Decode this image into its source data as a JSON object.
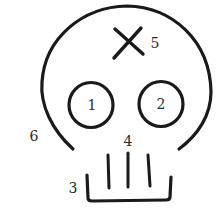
{
  "diagram": {
    "colors": {
      "background": "#ffffff",
      "stroke": "#1a1a1a",
      "label": "#2a2a2a"
    },
    "labels": {
      "left_eye": "1",
      "right_eye": "2",
      "jaw": "3",
      "teeth": "4",
      "forehead_mark": "5",
      "cranium": "6"
    }
  }
}
